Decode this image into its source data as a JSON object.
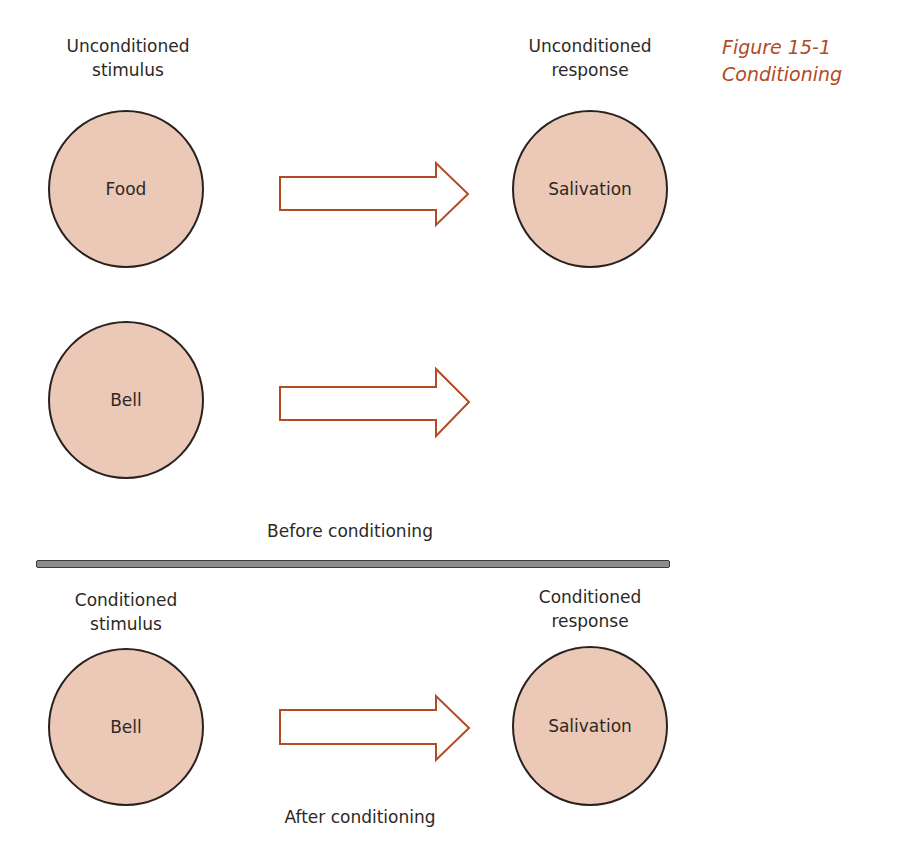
{
  "figure": {
    "number": "Figure 15-1",
    "title": "Conditioning"
  },
  "colors": {
    "circle_fill": "#ecc8b6",
    "circle_stroke": "#2a2220",
    "arrow_stroke": "#b24a24",
    "caption_color": "#b24a24",
    "divider_fill": "#8c8c8c"
  },
  "before": {
    "caption": "Before conditioning",
    "rows": [
      {
        "left_header": [
          "Unconditioned",
          "stimulus"
        ],
        "left_node": "Food",
        "right_header": [
          "Unconditioned",
          "response"
        ],
        "right_node": "Salivation"
      },
      {
        "left_node": "Bell",
        "right_node": ""
      }
    ]
  },
  "after": {
    "caption": "After conditioning",
    "left_header": [
      "Conditioned",
      "stimulus"
    ],
    "left_node": "Bell",
    "right_header": [
      "Conditioned",
      "response"
    ],
    "right_node": "Salivation"
  }
}
